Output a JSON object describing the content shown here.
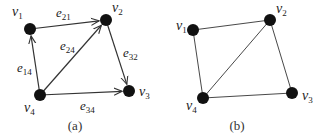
{
  "graphs": [
    {
      "id": "a",
      "caption": "(a)",
      "directed": true,
      "nodes": [
        {
          "id": "v1",
          "base": "v",
          "sub": "1",
          "x": 30,
          "y": 29,
          "lx": 12,
          "ly": 16
        },
        {
          "id": "v2",
          "base": "v",
          "sub": "2",
          "x": 106,
          "y": 20,
          "lx": 112,
          "ly": 12
        },
        {
          "id": "v3",
          "base": "v",
          "sub": "3",
          "x": 129,
          "y": 91,
          "lx": 139,
          "ly": 96
        },
        {
          "id": "v4",
          "base": "v",
          "sub": "4",
          "x": 40,
          "y": 95,
          "lx": 24,
          "ly": 112
        }
      ],
      "edges": [
        {
          "from": "v1",
          "to": "v2",
          "base": "e",
          "sub": "21",
          "lx": 56,
          "ly": 17
        },
        {
          "from": "v4",
          "to": "v1",
          "base": "e",
          "sub": "14",
          "lx": 17,
          "ly": 72
        },
        {
          "from": "v4",
          "to": "v2",
          "base": "e",
          "sub": "24",
          "lx": 60,
          "ly": 50
        },
        {
          "from": "v2",
          "to": "v3",
          "base": "e",
          "sub": "32",
          "lx": 123,
          "ly": 57
        },
        {
          "from": "v4",
          "to": "v3",
          "base": "e",
          "sub": "34",
          "lx": 80,
          "ly": 110
        }
      ],
      "caption_x": 75,
      "caption_y": 130
    },
    {
      "id": "b",
      "caption": "(b)",
      "directed": false,
      "nodes": [
        {
          "id": "v1",
          "base": "v",
          "sub": "1",
          "x": 193,
          "y": 30,
          "lx": 176,
          "ly": 30
        },
        {
          "id": "v2",
          "base": "v",
          "sub": "2",
          "x": 270,
          "y": 20,
          "lx": 276,
          "ly": 13
        },
        {
          "id": "v3",
          "base": "v",
          "sub": "3",
          "x": 292,
          "y": 93,
          "lx": 302,
          "ly": 100
        },
        {
          "id": "v4",
          "base": "v",
          "sub": "4",
          "x": 203,
          "y": 98,
          "lx": 186,
          "ly": 110
        }
      ],
      "edges": [
        {
          "from": "v1",
          "to": "v2"
        },
        {
          "from": "v1",
          "to": "v4"
        },
        {
          "from": "v4",
          "to": "v2"
        },
        {
          "from": "v2",
          "to": "v3"
        },
        {
          "from": "v4",
          "to": "v3"
        }
      ],
      "caption_x": 237,
      "caption_y": 130
    }
  ],
  "style": {
    "node_color": "#111111",
    "edge_color": "#333333",
    "node_radius": 6
  }
}
